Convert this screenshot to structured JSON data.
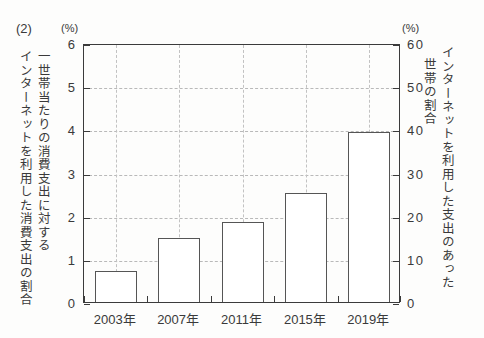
{
  "figure": {
    "number_label": "(2)",
    "unit_left": "(%)",
    "unit_right": "(%)",
    "caption_left_inner": "一世帯当たりの消費支出に対する",
    "caption_left_outer": "インターネットを利用した消費支出の割合",
    "caption_right_outer": "インターネットを利用した支出のあった",
    "caption_right_inner": "世帯の割合"
  },
  "chart_data": {
    "type": "bar",
    "title": "",
    "subtitle": "",
    "xlabel": "",
    "ylabel": "一世帯当たりの消費支出に対するインターネットを利用した消費支出の割合",
    "ylabel_right": "インターネットを利用した支出のあった世帯の割合",
    "categories": [
      "2003年",
      "2007年",
      "2011年",
      "2015年",
      "2019年"
    ],
    "values": [
      0.72,
      1.48,
      1.85,
      2.53,
      3.93
    ],
    "values_right_scale": [
      7.2,
      14.8,
      18.5,
      25.3,
      39.3
    ],
    "unit_left": "(%)",
    "unit_right": "(%)",
    "ylim": [
      0,
      6
    ],
    "ylim_right": [
      0,
      60
    ],
    "yticks": [
      "0",
      "1",
      "2",
      "3",
      "4",
      "5",
      "6"
    ],
    "yticks_right": [
      "0",
      "10",
      "20",
      "30",
      "40",
      "50",
      "60"
    ],
    "grid": true,
    "legend": "none",
    "bar_style": "outline",
    "bar_fill": "#ffffff",
    "bar_edge": "#555555",
    "grid_color": "#bdbdbd",
    "axis_color": "#3b3b3b"
  }
}
